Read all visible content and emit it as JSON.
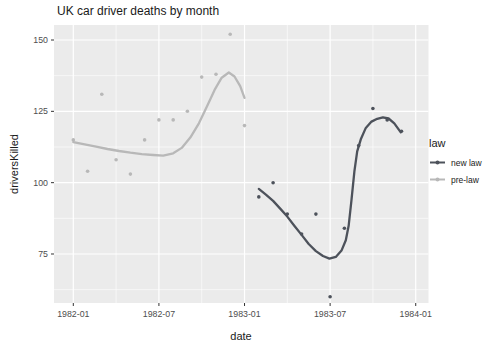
{
  "chart_data": {
    "type": "scatter",
    "title": "UK car driver deaths by month",
    "xlabel": "date",
    "ylabel": "driversKilled",
    "x_ticks": [
      {
        "month": 0,
        "label": "1982-01"
      },
      {
        "month": 6,
        "label": "1982-07"
      },
      {
        "month": 12,
        "label": "1983-01"
      },
      {
        "month": 18,
        "label": "1983-07"
      },
      {
        "month": 24,
        "label": "1984-01"
      }
    ],
    "x_minor_ticks": [
      3,
      9,
      15,
      21
    ],
    "y_ticks": [
      75,
      100,
      125,
      150
    ],
    "y_minor_ticks": [
      62.5,
      87.5,
      112.5,
      137.5
    ],
    "ylim": [
      57.8,
      155.3
    ],
    "xlim_months": [
      -1.35,
      24.9
    ],
    "grid": true,
    "legend": {
      "title": "law",
      "position": "right",
      "items": [
        {
          "label": "new law",
          "color": "#4d525b"
        },
        {
          "label": "pre-law",
          "color": "#b8b8b8"
        }
      ]
    },
    "series": [
      {
        "name": "new law",
        "color": "#4d525b",
        "points": [
          {
            "date": "1983-02",
            "value": 95
          },
          {
            "date": "1983-03",
            "value": 100
          },
          {
            "date": "1983-04",
            "value": 89
          },
          {
            "date": "1983-05",
            "value": 82
          },
          {
            "date": "1983-06",
            "value": 89
          },
          {
            "date": "1983-07",
            "value": 60
          },
          {
            "date": "1983-08",
            "value": 84
          },
          {
            "date": "1983-09",
            "value": 113
          },
          {
            "date": "1983-10",
            "value": 126
          },
          {
            "date": "1983-11",
            "value": 122
          },
          {
            "date": "1983-12",
            "value": 118
          }
        ],
        "smooth": [
          [
            13,
            97.8
          ],
          [
            13.5,
            95.8
          ],
          [
            14,
            93.6
          ],
          [
            14.5,
            90.9
          ],
          [
            15,
            88.1
          ],
          [
            15.5,
            84.8
          ],
          [
            16,
            81.7
          ],
          [
            16.5,
            78.5
          ],
          [
            17,
            76
          ],
          [
            17.5,
            74.3
          ],
          [
            17.95,
            73.4
          ],
          [
            18.4,
            74
          ],
          [
            18.8,
            76.2
          ],
          [
            19.1,
            79.8
          ],
          [
            19.3,
            85
          ],
          [
            19.5,
            94
          ],
          [
            19.7,
            104
          ],
          [
            19.9,
            111
          ],
          [
            20.15,
            115.2
          ],
          [
            20.5,
            119.2
          ],
          [
            20.9,
            121.4
          ],
          [
            21.3,
            122.4
          ],
          [
            21.7,
            122.9
          ],
          [
            22.1,
            122.5
          ],
          [
            22.5,
            120.8
          ],
          [
            22.95,
            117.6
          ]
        ]
      },
      {
        "name": "pre-law",
        "color": "#b8b8b8",
        "points": [
          {
            "date": "1982-01",
            "value": 115
          },
          {
            "date": "1982-02",
            "value": 104
          },
          {
            "date": "1982-03",
            "value": 131
          },
          {
            "date": "1982-04",
            "value": 108
          },
          {
            "date": "1982-05",
            "value": 103
          },
          {
            "date": "1982-06",
            "value": 115
          },
          {
            "date": "1982-07",
            "value": 122
          },
          {
            "date": "1982-08",
            "value": 122
          },
          {
            "date": "1982-09",
            "value": 125
          },
          {
            "date": "1982-10",
            "value": 137
          },
          {
            "date": "1982-11",
            "value": 138
          },
          {
            "date": "1982-12",
            "value": 152
          },
          {
            "date": "1983-01",
            "value": 120
          }
        ],
        "smooth": [
          [
            0,
            114.2
          ],
          [
            0.8,
            113.4
          ],
          [
            1.6,
            112.6
          ],
          [
            2.4,
            111.8
          ],
          [
            3.2,
            111.1
          ],
          [
            4,
            110.5
          ],
          [
            4.8,
            110
          ],
          [
            5.6,
            109.7
          ],
          [
            6.3,
            109.5
          ],
          [
            7,
            110.3
          ],
          [
            7.6,
            112.2
          ],
          [
            8.2,
            115.8
          ],
          [
            8.8,
            120.8
          ],
          [
            9.4,
            127
          ],
          [
            9.9,
            132.5
          ],
          [
            10.4,
            136.8
          ],
          [
            10.9,
            138.6
          ],
          [
            11.3,
            137.2
          ],
          [
            11.7,
            133.8
          ],
          [
            12,
            129.7
          ]
        ]
      }
    ],
    "colors": {
      "panel_background": "#ebebeb",
      "grid": "#ffffff",
      "tick_mark": "#333333",
      "tick_label": "#4d4d4d",
      "text": "#1a1a1a"
    }
  }
}
